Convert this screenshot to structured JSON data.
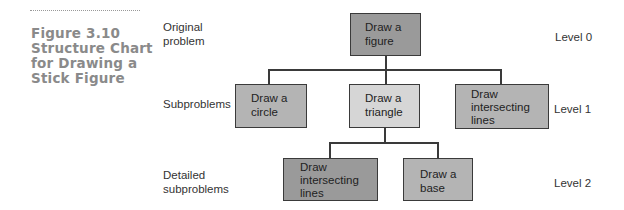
{
  "figure": {
    "number_title": "Figure 3.10",
    "caption_lines": [
      "Figure 3.10",
      "Structure Chart",
      "for Drawing a",
      "Stick Figure"
    ]
  },
  "row_labels": {
    "original": [
      "Original",
      "problem"
    ],
    "subproblems": [
      "Subproblems"
    ],
    "detailed": [
      "Detailed",
      "subproblems"
    ]
  },
  "levels": [
    "Level 0",
    "Level 1",
    "Level 2"
  ],
  "nodes": {
    "root": [
      "Draw a",
      "figure"
    ],
    "circle": [
      "Draw a",
      "circle"
    ],
    "triangle": [
      "Draw a",
      "triangle"
    ],
    "intersecting_l1": [
      "Draw",
      "intersecting",
      "lines"
    ],
    "intersecting_l2": [
      "Draw",
      "intersecting",
      "lines"
    ],
    "base": [
      "Draw a",
      "base"
    ]
  },
  "colors": {
    "dark_box": "#9a9a9a",
    "mid_box": "#b4b4b4",
    "light_box": "#d6d6d6",
    "caption": "#8a8a8a"
  }
}
